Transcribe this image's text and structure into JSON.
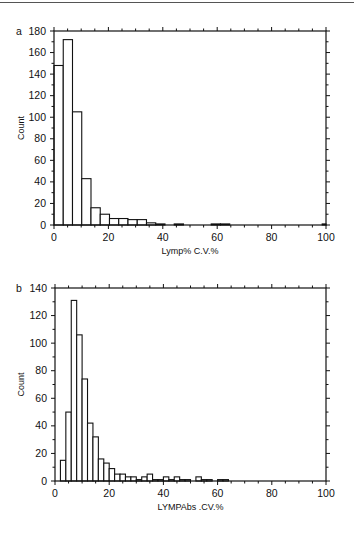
{
  "page": {
    "top_rule": true
  },
  "chart_data": [
    {
      "panel": "a",
      "type": "bar",
      "subtype": "histogram",
      "title": "",
      "xlabel": "Lymp% C.V.%",
      "ylabel": "Count",
      "xlim": [
        0,
        100
      ],
      "ylim": [
        0,
        180
      ],
      "xticks": [
        0,
        20,
        40,
        60,
        80,
        100
      ],
      "yticks": [
        0,
        20,
        40,
        60,
        80,
        100,
        120,
        140,
        160,
        180
      ],
      "grid": false,
      "bin_width": 3.4,
      "bins": [
        {
          "x0": 0.0,
          "x1": 3.4,
          "count": 148
        },
        {
          "x0": 3.4,
          "x1": 6.8,
          "count": 172
        },
        {
          "x0": 6.8,
          "x1": 10.2,
          "count": 105
        },
        {
          "x0": 10.2,
          "x1": 13.6,
          "count": 43
        },
        {
          "x0": 13.6,
          "x1": 17.0,
          "count": 16
        },
        {
          "x0": 17.0,
          "x1": 20.4,
          "count": 10
        },
        {
          "x0": 20.4,
          "x1": 23.8,
          "count": 6
        },
        {
          "x0": 23.8,
          "x1": 27.2,
          "count": 6
        },
        {
          "x0": 27.2,
          "x1": 30.6,
          "count": 5
        },
        {
          "x0": 30.6,
          "x1": 34.0,
          "count": 5
        },
        {
          "x0": 34.0,
          "x1": 37.4,
          "count": 2
        },
        {
          "x0": 37.4,
          "x1": 40.8,
          "count": 1
        },
        {
          "x0": 44.2,
          "x1": 47.6,
          "count": 1
        },
        {
          "x0": 57.8,
          "x1": 61.2,
          "count": 1
        },
        {
          "x0": 61.2,
          "x1": 64.6,
          "count": 1
        },
        {
          "x0": 98.6,
          "x1": 100.0,
          "count": 1
        }
      ]
    },
    {
      "panel": "b",
      "type": "bar",
      "subtype": "histogram",
      "title": "",
      "xlabel": "LYMPAbs .CV.%",
      "ylabel": "Count",
      "xlim": [
        0,
        100
      ],
      "ylim": [
        0,
        140
      ],
      "xticks": [
        0,
        20,
        40,
        60,
        80,
        100
      ],
      "yticks": [
        0,
        20,
        40,
        60,
        80,
        100,
        120,
        140
      ],
      "grid": false,
      "bin_width": 2,
      "bins": [
        {
          "x0": 2,
          "x1": 4,
          "count": 15
        },
        {
          "x0": 4,
          "x1": 6,
          "count": 50
        },
        {
          "x0": 6,
          "x1": 8,
          "count": 131
        },
        {
          "x0": 8,
          "x1": 10,
          "count": 106
        },
        {
          "x0": 10,
          "x1": 12,
          "count": 74
        },
        {
          "x0": 12,
          "x1": 14,
          "count": 42
        },
        {
          "x0": 14,
          "x1": 16,
          "count": 32
        },
        {
          "x0": 16,
          "x1": 18,
          "count": 16
        },
        {
          "x0": 18,
          "x1": 20,
          "count": 13
        },
        {
          "x0": 20,
          "x1": 22,
          "count": 9
        },
        {
          "x0": 22,
          "x1": 24,
          "count": 5
        },
        {
          "x0": 24,
          "x1": 26,
          "count": 5
        },
        {
          "x0": 26,
          "x1": 28,
          "count": 3
        },
        {
          "x0": 28,
          "x1": 30,
          "count": 3
        },
        {
          "x0": 30,
          "x1": 32,
          "count": 1
        },
        {
          "x0": 32,
          "x1": 34,
          "count": 3
        },
        {
          "x0": 34,
          "x1": 36,
          "count": 5
        },
        {
          "x0": 36,
          "x1": 38,
          "count": 1
        },
        {
          "x0": 38,
          "x1": 40,
          "count": 1
        },
        {
          "x0": 40,
          "x1": 42,
          "count": 3
        },
        {
          "x0": 42,
          "x1": 44,
          "count": 1
        },
        {
          "x0": 44,
          "x1": 46,
          "count": 3
        },
        {
          "x0": 46,
          "x1": 48,
          "count": 1
        },
        {
          "x0": 48,
          "x1": 50,
          "count": 1
        },
        {
          "x0": 52,
          "x1": 54,
          "count": 3
        },
        {
          "x0": 54,
          "x1": 56,
          "count": 1
        },
        {
          "x0": 56,
          "x1": 58,
          "count": 1
        },
        {
          "x0": 60,
          "x1": 62,
          "count": 1
        },
        {
          "x0": 62,
          "x1": 64,
          "count": 1
        }
      ]
    }
  ]
}
